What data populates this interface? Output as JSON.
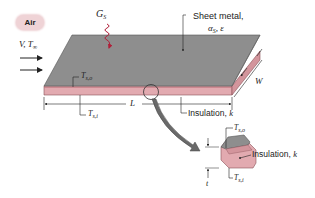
{
  "diagram": {
    "colors": {
      "sheet_top": "#8e8e8e",
      "sheet_edge": "#6d6d6d",
      "insulation": "#e2aab0",
      "insulation_dark": "#c9868e",
      "irradiation_arrow": "#b0203a",
      "air_cloud": "#efd3d6",
      "callout_arrow": "#6a6a6a"
    },
    "air": {
      "label": "Air",
      "flow_label_V": "V",
      "flow_label_T": "T",
      "flow_label_T_sub": "∞"
    },
    "irradiation": {
      "symbol": "G",
      "subscript": "S"
    },
    "sheet_metal": {
      "label": "Sheet metal,",
      "properties_alpha": "α",
      "properties_alpha_sub": "S",
      "properties_eps": ", ε"
    },
    "dimensions": {
      "length": "L",
      "width": "W",
      "thickness": "t"
    },
    "temperatures": {
      "outer": {
        "symbol": "T",
        "subscript": "s,o"
      },
      "inner": {
        "symbol": "T",
        "subscript": "s,i"
      }
    },
    "insulation": {
      "label": "Insulation,",
      "k": "k"
    },
    "detail": {
      "outer": {
        "symbol": "T",
        "subscript": "s,o"
      },
      "inner": {
        "symbol": "T",
        "subscript": "s,i"
      },
      "insulation_label": "Insulation,",
      "insulation_k": "k",
      "thickness": "t"
    }
  }
}
